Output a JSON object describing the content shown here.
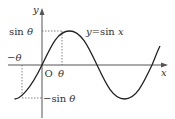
{
  "diagram": {
    "axes": {
      "x_label": "x",
      "y_label": "y",
      "origin_label": "O"
    },
    "curve_label": "y=sin x",
    "curve_label_parts": {
      "lhs": "y",
      "eq": "=sin ",
      "var": "x"
    },
    "marks": {
      "theta": "θ",
      "neg_theta": "−θ",
      "sin_theta_fn": "sin ",
      "sin_theta_arg": "θ",
      "neg_sin_theta_fn": "−sin ",
      "neg_sin_theta_arg": "θ"
    },
    "colors": {
      "curve": "#222222",
      "axis": "#555555",
      "dashed": "#666666",
      "text": "#333333"
    }
  }
}
